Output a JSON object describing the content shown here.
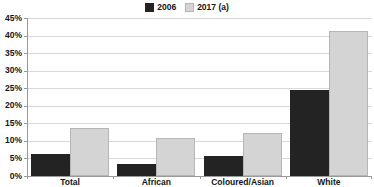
{
  "chart_data": {
    "type": "bar",
    "title": "",
    "subtitle": "",
    "xlabel": "",
    "ylabel": "",
    "categories": [
      "Total",
      "African",
      "Coloured/Asian",
      "White"
    ],
    "series": [
      {
        "name": "2006",
        "color": "#232323",
        "values": [
          6.3,
          3.3,
          5.7,
          24.5
        ]
      },
      {
        "name": "2017 (a)",
        "color": "#d4d4d4",
        "values": [
          13.8,
          10.9,
          12.2,
          41.3
        ]
      }
    ],
    "ylim": [
      0,
      45
    ],
    "ytick_step": 5,
    "ytick_labels": [
      "0%",
      "5%",
      "10%",
      "15%",
      "20%",
      "25%",
      "30%",
      "35%",
      "40%",
      "45%"
    ],
    "ytick_values": [
      0,
      5,
      10,
      15,
      20,
      25,
      30,
      35,
      40,
      45
    ],
    "grid": true,
    "grid_axis": "y",
    "legend": {
      "position": "top-center",
      "entries": [
        {
          "label": "2006",
          "color": "#232323"
        },
        {
          "label": "2017 (a)",
          "color": "#d4d4d4"
        }
      ]
    },
    "value_labels": false,
    "background": "#ffffff",
    "axis_color": "#9a9a9a",
    "grid_color": "#d9d9d9",
    "text_color": "#141414"
  }
}
